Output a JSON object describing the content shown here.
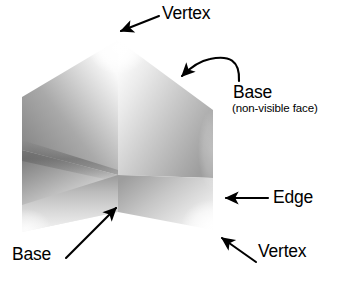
{
  "figure": {
    "background_color": "#ffffff",
    "ink_color": "#000000",
    "shape": {
      "name": "trihedral-corner-solid",
      "description": "Three shaded quadrilateral faces meeting at a central interior vertex, forming a hexagonal silhouette",
      "faces": [
        {
          "name": "left-face",
          "shade_light": "#f2f2f2",
          "shade_dark": "#6e6e6e"
        },
        {
          "name": "right-face",
          "shade_light": "#fbfbfb",
          "shade_dark": "#909090"
        },
        {
          "name": "front-face",
          "shade_light": "#fcfcfc",
          "shade_dark": "#949494"
        }
      ],
      "vertices": {
        "apex_top": [
          118,
          40
        ],
        "left_upper": [
          22,
          97
        ],
        "right_upper": [
          213,
          110
        ],
        "left_lower": [
          22,
          232
        ],
        "right_lower": [
          213,
          230
        ],
        "center": [
          118,
          175
        ],
        "bottom_notch": [
          118,
          212
        ]
      }
    },
    "annotations": [
      {
        "id": "vertex-top",
        "label": "Vertex",
        "arrow": "straight",
        "points_to": "apex_top",
        "direction": "down-left"
      },
      {
        "id": "base-right",
        "label": "Base",
        "sublabel": "(non-visible face)",
        "arrow": "curved",
        "points_to": "upper-right-face",
        "direction": "up-left"
      },
      {
        "id": "edge",
        "label": "Edge",
        "arrow": "straight",
        "points_to": "right-silhouette-edge",
        "direction": "left"
      },
      {
        "id": "vertex-bottom",
        "label": "Vertex",
        "arrow": "straight",
        "points_to": "right_lower",
        "direction": "up-left"
      },
      {
        "id": "base-bottom",
        "label": "Base",
        "arrow": "straight",
        "points_to": "front-face",
        "direction": "up-right"
      }
    ]
  }
}
